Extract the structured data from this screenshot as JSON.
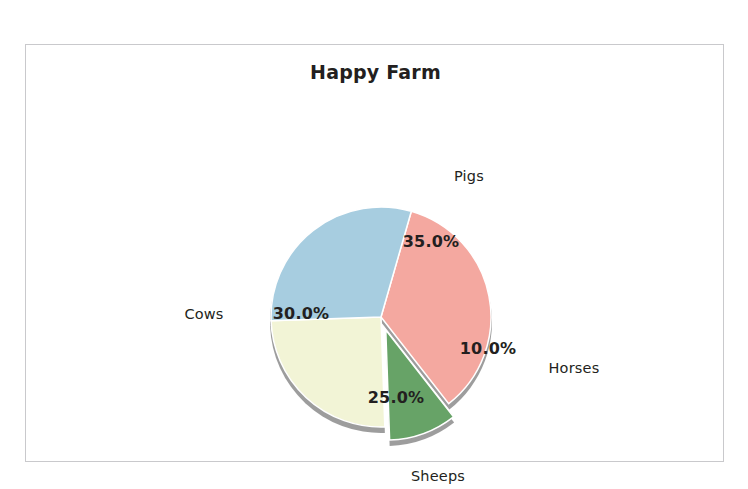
{
  "chart_data": {
    "type": "pie",
    "title": "Happy Farm",
    "categories": [
      "Pigs",
      "Horses",
      "Sheeps",
      "Cows"
    ],
    "values": [
      35.0,
      10.0,
      25.0,
      30.0
    ],
    "value_labels": [
      "35.0%",
      "10.0%",
      "25.0%",
      "30.0%"
    ],
    "colors": [
      "#f4a8a0",
      "#67a367",
      "#f2f4d6",
      "#a7cde0"
    ],
    "exploded": [
      "Horses"
    ],
    "legend": "none",
    "grid": false,
    "xlabel": "",
    "ylabel": "",
    "units": "percent",
    "slices": [
      {
        "name": "Pigs",
        "value": 35.0,
        "value_label": "35.0%",
        "color": "#f4a8a0",
        "exploded": false,
        "label_x": 443,
        "label_y": 131,
        "pct_x": 405,
        "pct_y": 196
      },
      {
        "name": "Horses",
        "value": 10.0,
        "value_label": "10.0%",
        "color": "#67a367",
        "exploded": true,
        "label_x": 548,
        "label_y": 323,
        "pct_x": 462,
        "pct_y": 303
      },
      {
        "name": "Sheeps",
        "value": 25.0,
        "value_label": "25.0%",
        "color": "#f2f4d6",
        "exploded": false,
        "label_x": 412,
        "label_y": 431,
        "pct_x": 370,
        "pct_y": 352
      },
      {
        "name": "Cows",
        "value": 30.0,
        "value_label": "30.0%",
        "color": "#a7cde0",
        "exploded": false,
        "label_x": 178,
        "label_y": 269,
        "pct_x": 275,
        "pct_y": 268
      }
    ],
    "geometry": {
      "center_x": 355,
      "center_y": 272,
      "radius": 110,
      "start_angle_deg": -74,
      "explode_offset": 14,
      "shadow_color": "#8c8c8c",
      "edge_color": "#ffffff"
    }
  },
  "page": {
    "background": "#ffffff",
    "frame_border_color": "#c9c9cc"
  }
}
